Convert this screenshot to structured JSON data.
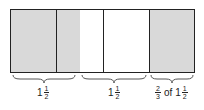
{
  "diagram": {
    "colors": {
      "shaded": "#d9d9d9",
      "unshaded": "#ffffff",
      "stroke": "#222222"
    },
    "segments": [
      {
        "x": 0,
        "w": 46,
        "fill": "shaded"
      },
      {
        "x": 46,
        "w": 23,
        "fill": "shaded"
      },
      {
        "x": 69,
        "w": 24,
        "fill": "unshaded"
      },
      {
        "x": 93,
        "w": 46,
        "fill": "unshaded"
      },
      {
        "x": 139,
        "w": 46,
        "fill": "shaded"
      }
    ],
    "dividers_x": [
      46,
      69,
      93,
      139
    ],
    "groups": [
      {
        "label_whole": "1",
        "label_num": "1",
        "label_den": "2",
        "brace_left": 12,
        "brace_width": 64
      },
      {
        "label_whole": "1",
        "label_num": "1",
        "label_den": "2",
        "brace_left": 81,
        "brace_width": 66
      },
      {
        "label_prefix_num": "2",
        "label_prefix_den": "3",
        "label_of": "of",
        "label_whole": "1",
        "label_num": "1",
        "label_den": "2",
        "brace_left": 150,
        "brace_width": 44
      }
    ]
  }
}
